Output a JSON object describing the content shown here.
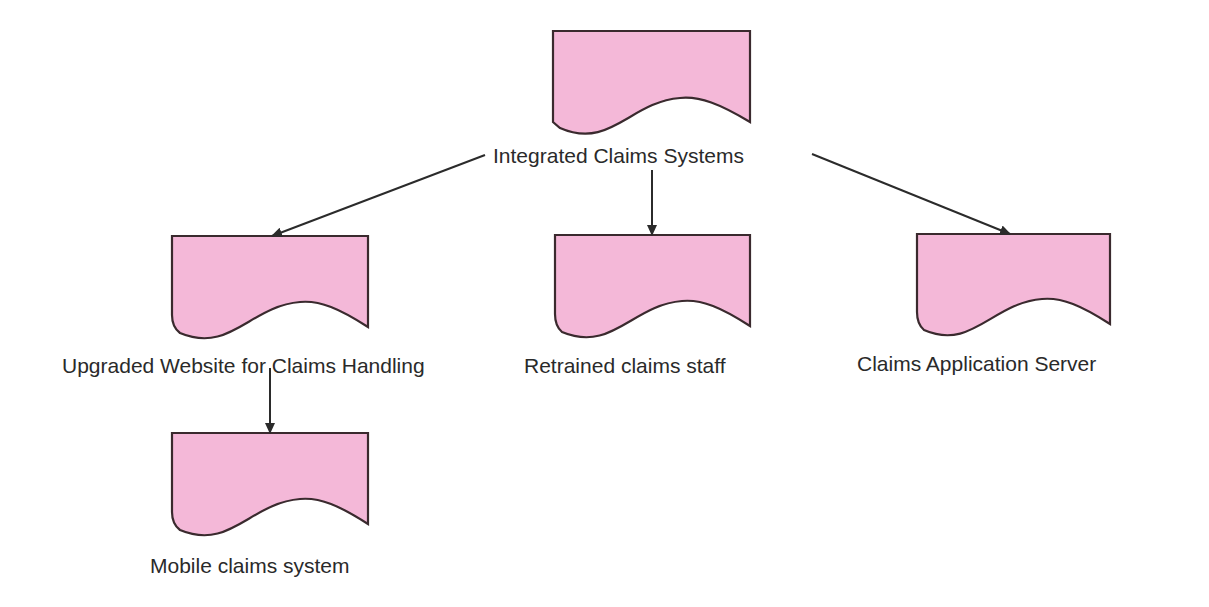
{
  "diagram": {
    "type": "hierarchy",
    "shape_style": "document",
    "colors": {
      "shape_fill": "#f4b8d8",
      "shape_stroke": "#3a2a2e",
      "connector": "#2b2b2b",
      "text": "#2a2a2a",
      "background": "#ffffff"
    },
    "nodes": [
      {
        "id": "root",
        "label": "Integrated Claims Systems"
      },
      {
        "id": "website",
        "label": "Upgraded Website for Claims Handling"
      },
      {
        "id": "staff",
        "label": "Retrained claims staff"
      },
      {
        "id": "server",
        "label": "Claims Application Server"
      },
      {
        "id": "mobile",
        "label": "Mobile claims system"
      }
    ],
    "edges": [
      {
        "from": "root",
        "to": "website"
      },
      {
        "from": "root",
        "to": "staff"
      },
      {
        "from": "root",
        "to": "server"
      },
      {
        "from": "website",
        "to": "mobile"
      }
    ]
  }
}
